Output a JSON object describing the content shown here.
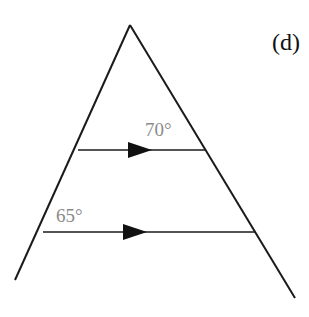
{
  "figure": {
    "panel_label": "(d)",
    "stroke_color": "#1a1a1a",
    "label_color": "#8a8a8a",
    "lines": {
      "left_side": {
        "x1": 130,
        "y1": 25,
        "x2": 15,
        "y2": 280
      },
      "right_side": {
        "x1": 130,
        "y1": 25,
        "x2": 295,
        "y2": 298
      },
      "upper_parallel": {
        "x1": 78,
        "y1": 150,
        "x2": 205,
        "y2": 150
      },
      "lower_parallel": {
        "x1": 43,
        "y1": 232,
        "x2": 255,
        "y2": 232
      }
    },
    "angles": [
      {
        "label": "70°",
        "position": "upper parallel line, near right side"
      },
      {
        "label": "65°",
        "position": "lower parallel line, near left side"
      }
    ],
    "arrow_markers": [
      "arrow-right",
      "arrow-right"
    ]
  }
}
